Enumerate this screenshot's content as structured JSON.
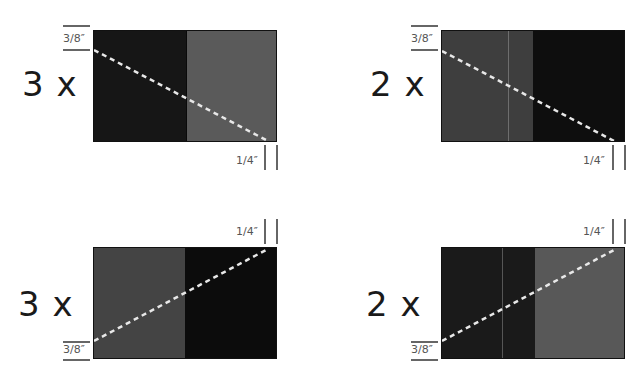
{
  "diagram": {
    "colors": {
      "dark": "#151515",
      "medium": "#555555",
      "medium_alt": "#3c3c3c",
      "cut_line": "#e8e8e8",
      "border": "#111111",
      "measure_line": "#666666"
    },
    "panels": [
      {
        "id": "top-left",
        "multiplier": "3 x",
        "left_color": "#161616",
        "right_color": "#5a5a5a",
        "cut_direction": "down",
        "top_measure": "3/8″",
        "bottom_measure": "1/4″"
      },
      {
        "id": "top-right",
        "multiplier": "2 x",
        "left_color": "#3e3e3e",
        "right_color": "#0e0e0e",
        "cut_direction": "down",
        "top_measure": "3/8″",
        "bottom_measure": "1/4″"
      },
      {
        "id": "bottom-left",
        "multiplier": "3 x",
        "left_color": "#444444",
        "right_color": "#0c0c0c",
        "cut_direction": "up",
        "top_measure": "1/4″",
        "bottom_measure": "3/8″"
      },
      {
        "id": "bottom-right",
        "multiplier": "2 x",
        "left_color": "#1a1a1a",
        "right_color": "#585858",
        "cut_direction": "up",
        "top_measure": "1/4″",
        "bottom_measure": "3/8″"
      }
    ]
  }
}
